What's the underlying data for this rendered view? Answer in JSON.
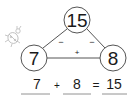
{
  "diagram": {
    "type": "number-bond-triangle",
    "top": {
      "value": "15"
    },
    "bottom_left": {
      "value": "7"
    },
    "bottom_right": {
      "value": "8"
    },
    "edges": {
      "left_operator": "−",
      "right_operator": "−",
      "bottom_operator": "+"
    }
  },
  "equation": {
    "operand1": "7",
    "operator": "+",
    "operand2": "8",
    "equals": "=",
    "result": "15"
  },
  "decoration": {
    "icon": "ladybug-icon"
  },
  "colors": {
    "stroke": "#555555",
    "text": "#1a1a1a",
    "sketch": "#bbbbbb"
  }
}
